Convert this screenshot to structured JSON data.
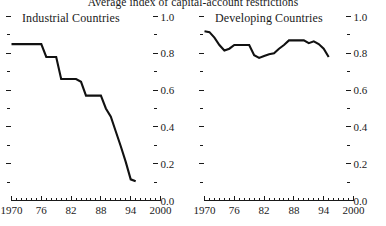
{
  "chart_data": {
    "type": "line",
    "title": "Average index of capital-account restrictions",
    "xlabel": "",
    "ylabel": "",
    "xlim": [
      1970,
      2000
    ],
    "ylim": [
      0.0,
      1.0
    ],
    "grid": false,
    "legend": "none",
    "panels": [
      {
        "name": "Industrial Countries",
        "label": "Industrial Countries",
        "x": [
          1970,
          1971,
          1972,
          1973,
          1974,
          1975,
          1976,
          1977,
          1978,
          1979,
          1980,
          1981,
          1982,
          1983,
          1984,
          1985,
          1986,
          1987,
          1988,
          1989,
          1990,
          1991,
          1992,
          1993,
          1994,
          1995
        ],
        "values": [
          0.85,
          0.85,
          0.85,
          0.85,
          0.85,
          0.85,
          0.85,
          0.78,
          0.78,
          0.78,
          0.66,
          0.66,
          0.66,
          0.66,
          0.645,
          0.57,
          0.57,
          0.57,
          0.57,
          0.5,
          0.455,
          0.375,
          0.295,
          0.21,
          0.115,
          0.105
        ]
      },
      {
        "name": "Developing Countries",
        "label": "Developing Countries",
        "x": [
          1970,
          1971,
          1972,
          1973,
          1974,
          1975,
          1976,
          1977,
          1978,
          1979,
          1980,
          1981,
          1982,
          1983,
          1984,
          1985,
          1986,
          1987,
          1988,
          1989,
          1990,
          1991,
          1992,
          1993,
          1994,
          1995
        ],
        "values": [
          0.92,
          0.915,
          0.885,
          0.845,
          0.815,
          0.825,
          0.845,
          0.845,
          0.845,
          0.845,
          0.79,
          0.775,
          0.785,
          0.795,
          0.8,
          0.825,
          0.845,
          0.87,
          0.87,
          0.87,
          0.87,
          0.855,
          0.865,
          0.85,
          0.825,
          0.78
        ]
      }
    ],
    "y_ticks_major": [
      {
        "value": 1.0,
        "label": "1.0"
      },
      {
        "value": 0.8,
        "label": "0.8"
      },
      {
        "value": 0.6,
        "label": "0.6"
      },
      {
        "value": 0.4,
        "label": "0.4"
      },
      {
        "value": 0.2,
        "label": "0.2"
      },
      {
        "value": 0.0,
        "label": "0.0"
      }
    ],
    "y_ticks_minor": [
      0.9,
      0.7,
      0.5,
      0.3,
      0.1
    ],
    "x_ticks_major": [
      {
        "value": 1970,
        "label": "1970"
      },
      {
        "value": 1976,
        "label": "76"
      },
      {
        "value": 1982,
        "label": "82"
      },
      {
        "value": 1988,
        "label": "88"
      },
      {
        "value": 1994,
        "label": "94"
      },
      {
        "value": 2000,
        "label": "2000"
      }
    ],
    "x_tick_step_minor": 1,
    "line_color": "#111111",
    "axis_color": "#1a1a1a"
  }
}
